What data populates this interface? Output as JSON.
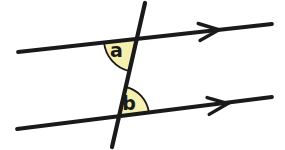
{
  "diagram": {
    "background_color": "#ffffff",
    "line_color": "#1a1a1a",
    "angle_fill_color": "#f5efb0",
    "label_color": "#1a1a1a",
    "labels": {
      "a": {
        "text": "a",
        "transform": "translate(116.5,57)"
      },
      "b": {
        "text": "b",
        "transform": "translate(129,110)"
      }
    },
    "paths": {
      "top_line": "M18,52 L272,24",
      "bottom_line": "M17,129 L272,97",
      "transversal": "M145,3 L112,147",
      "top_arrow": "M198.2,23.5 L219,29.8 L200,40.4",
      "bottom_arrow": "M207.1,97.6 L228,103.5 L209.2,114.4",
      "angle_a_sector": "M136.8,38.9 L104,42.5 A33,33 0 0 0 129.4,71.1 Z",
      "angle_b_sector": "M119.1,116.2 L125.8,87 A30,30 0 0 1 148.9,112.5 Z"
    }
  }
}
